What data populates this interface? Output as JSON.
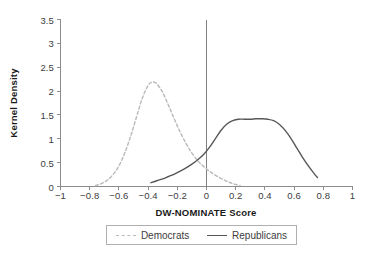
{
  "chart_data": {
    "type": "line",
    "title": "",
    "xlabel": "DW-NOMINATE Score",
    "ylabel": "Kernel Density",
    "xlim": [
      -1,
      1
    ],
    "ylim": [
      0,
      3.5
    ],
    "grid": false,
    "legend_position": "bottom",
    "annotations": [
      {
        "type": "vertical-line",
        "x": 0
      }
    ],
    "xticks": [
      "-1",
      "-0.8",
      "-0.6",
      "-0.4",
      "-0.2",
      "0",
      "0.2",
      "0.4",
      "0.6",
      "0.8",
      "1"
    ],
    "xtick_values": [
      -1,
      -0.8,
      -0.6,
      -0.4,
      -0.2,
      0,
      0.2,
      0.4,
      0.6,
      0.8,
      1
    ],
    "yticks": [
      "0",
      "0.5",
      "1",
      "1.5",
      "2",
      "2.5",
      "3",
      "3.5"
    ],
    "ytick_values": [
      0,
      0.5,
      1,
      1.5,
      2,
      2.5,
      3,
      3.5
    ],
    "series": [
      {
        "name": "Democrats",
        "style": "dashed",
        "color": "#b9b9b9",
        "x": [
          -0.76,
          -0.72,
          -0.68,
          -0.64,
          -0.6,
          -0.56,
          -0.52,
          -0.48,
          -0.44,
          -0.4,
          -0.37,
          -0.34,
          -0.3,
          -0.26,
          -0.22,
          -0.18,
          -0.14,
          -0.1,
          -0.06,
          -0.02,
          0.02,
          0.06,
          0.1,
          0.14,
          0.18,
          0.23
        ],
        "values": [
          0.02,
          0.06,
          0.13,
          0.25,
          0.43,
          0.7,
          1.05,
          1.45,
          1.85,
          2.12,
          2.19,
          2.15,
          1.97,
          1.7,
          1.41,
          1.14,
          0.9,
          0.7,
          0.54,
          0.42,
          0.32,
          0.24,
          0.17,
          0.11,
          0.06,
          0.02
        ]
      },
      {
        "name": "Republicans",
        "style": "solid",
        "color": "#575757",
        "x": [
          -0.38,
          -0.34,
          -0.3,
          -0.26,
          -0.22,
          -0.18,
          -0.14,
          -0.1,
          -0.06,
          -0.02,
          0.02,
          0.06,
          0.1,
          0.14,
          0.18,
          0.22,
          0.26,
          0.3,
          0.34,
          0.38,
          0.42,
          0.46,
          0.5,
          0.54,
          0.58,
          0.62,
          0.66,
          0.7,
          0.74,
          0.76
        ],
        "values": [
          0.08,
          0.12,
          0.16,
          0.21,
          0.26,
          0.32,
          0.39,
          0.47,
          0.56,
          0.67,
          0.82,
          1.0,
          1.18,
          1.31,
          1.38,
          1.41,
          1.41,
          1.41,
          1.42,
          1.42,
          1.41,
          1.38,
          1.3,
          1.17,
          1.0,
          0.8,
          0.6,
          0.42,
          0.26,
          0.19
        ]
      }
    ]
  },
  "legend": {
    "entries": [
      {
        "label": "Democrats",
        "style": "dem"
      },
      {
        "label": "Republicans",
        "style": "rep"
      }
    ]
  }
}
